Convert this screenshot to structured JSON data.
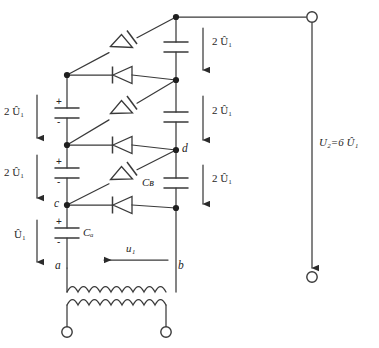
{
  "figure": {
    "type": "circuit-schematic"
  },
  "labels": {
    "stage_voltage": "2 Û₁",
    "first_stage_voltage": "Û₁",
    "input_voltage": "u₁",
    "output_voltage": "U₂=6 Û₁",
    "node_a": "a",
    "node_b": "b",
    "node_c": "c",
    "node_d": "d",
    "cap_a": "Cₐ",
    "cap_b": "Cʙ",
    "polarity_plus": "+",
    "polarity_minus": "-"
  },
  "left_column_voltages": [
    {
      "text": "2 Û₁",
      "y": 112
    },
    {
      "text": "2 Û₁",
      "y": 172
    },
    {
      "text": "Û₁",
      "y": 235
    }
  ],
  "right_column_voltages": [
    {
      "text": "2 Û₁",
      "y": 42
    },
    {
      "text": "2 Û₁",
      "y": 112
    },
    {
      "text": "2 Û₁",
      "y": 180
    }
  ],
  "components": {
    "diagonal_diodes": 3,
    "horizontal_diodes": 3,
    "left_capacitors": 3,
    "right_capacitors": 3,
    "transformer_windings": 2,
    "terminals": 4
  },
  "colors": {
    "wire": "#3a3a3a",
    "node": "#1f1f1f",
    "text": "#262626",
    "background": "#ffffff"
  }
}
